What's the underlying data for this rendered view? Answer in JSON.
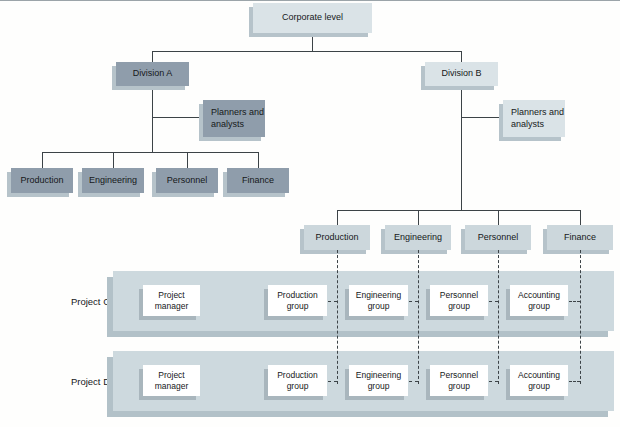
{
  "diagram": {
    "corporate": "Corporate level",
    "division_a": {
      "label": "Division A",
      "planners": "Planners and analysts",
      "departments": [
        "Production",
        "Engineering",
        "Personnel",
        "Finance"
      ]
    },
    "division_b": {
      "label": "Division B",
      "planners": "Planners and analysts",
      "departments": [
        "Production",
        "Engineering",
        "Personnel",
        "Finance"
      ]
    },
    "projects": [
      {
        "label": "Project C",
        "boxes": [
          "Project manager",
          "Production group",
          "Engineering group",
          "Personnel group",
          "Accounting group"
        ]
      },
      {
        "label": "Project D",
        "boxes": [
          "Project manager",
          "Production group",
          "Engineering group",
          "Personnel group",
          "Accounting group"
        ]
      }
    ]
  },
  "colors": {
    "dark_box": "#8f9dab",
    "light_box": "#dae3e7",
    "light_box_2": "#ccd7dc",
    "band": "#cdd9de",
    "box_shadow": "#b6c3ca",
    "white_box": "#ffffff",
    "connector": "#3c4347"
  }
}
